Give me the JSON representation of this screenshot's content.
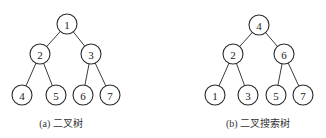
{
  "diagram": {
    "trees": [
      {
        "caption": "(a) 二叉树",
        "caption_x": 61,
        "nodes": [
          {
            "id": "a1",
            "label": "1",
            "x": 67,
            "y": 24
          },
          {
            "id": "a2",
            "label": "2",
            "x": 40,
            "y": 54
          },
          {
            "id": "a3",
            "label": "3",
            "x": 91,
            "y": 54
          },
          {
            "id": "a4",
            "label": "4",
            "x": 22,
            "y": 95
          },
          {
            "id": "a5",
            "label": "5",
            "x": 56,
            "y": 95
          },
          {
            "id": "a6",
            "label": "6",
            "x": 83,
            "y": 95
          },
          {
            "id": "a7",
            "label": "7",
            "x": 110,
            "y": 95
          }
        ],
        "edges": [
          [
            "a1",
            "a2"
          ],
          [
            "a1",
            "a3"
          ],
          [
            "a2",
            "a4"
          ],
          [
            "a2",
            "a5"
          ],
          [
            "a3",
            "a6"
          ],
          [
            "a3",
            "a7"
          ]
        ]
      },
      {
        "caption": "(b) 二叉搜索树",
        "caption_x": 258,
        "nodes": [
          {
            "id": "b4",
            "label": "4",
            "x": 259,
            "y": 25
          },
          {
            "id": "b2",
            "label": "2",
            "x": 233,
            "y": 54
          },
          {
            "id": "b6",
            "label": "6",
            "x": 284,
            "y": 54
          },
          {
            "id": "b1",
            "label": "1",
            "x": 215,
            "y": 95
          },
          {
            "id": "b3",
            "label": "3",
            "x": 248,
            "y": 95
          },
          {
            "id": "b5",
            "label": "5",
            "x": 276,
            "y": 95
          },
          {
            "id": "b7",
            "label": "7",
            "x": 303,
            "y": 95
          }
        ],
        "edges": [
          [
            "b4",
            "b2"
          ],
          [
            "b4",
            "b6"
          ],
          [
            "b2",
            "b1"
          ],
          [
            "b2",
            "b3"
          ],
          [
            "b6",
            "b5"
          ],
          [
            "b6",
            "b7"
          ]
        ]
      }
    ],
    "node_radius": 10
  }
}
